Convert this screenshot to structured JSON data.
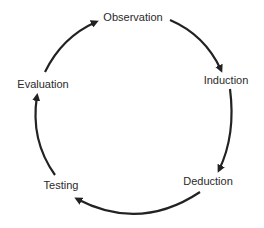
{
  "diagram": {
    "type": "cycle",
    "direction": "clockwise",
    "stroke_color": "#222222",
    "nodes": [
      {
        "id": "observation",
        "label": "Observation",
        "x": 133,
        "y": 17
      },
      {
        "id": "induction",
        "label": "Induction",
        "x": 226,
        "y": 80
      },
      {
        "id": "deduction",
        "label": "Deduction",
        "x": 208,
        "y": 181
      },
      {
        "id": "testing",
        "label": "Testing",
        "x": 61,
        "y": 185
      },
      {
        "id": "evaluation",
        "label": "Evaluation",
        "x": 43,
        "y": 84
      }
    ],
    "edges": [
      {
        "from": "observation",
        "to": "induction"
      },
      {
        "from": "induction",
        "to": "deduction"
      },
      {
        "from": "deduction",
        "to": "testing"
      },
      {
        "from": "testing",
        "to": "evaluation"
      },
      {
        "from": "evaluation",
        "to": "observation"
      }
    ]
  }
}
